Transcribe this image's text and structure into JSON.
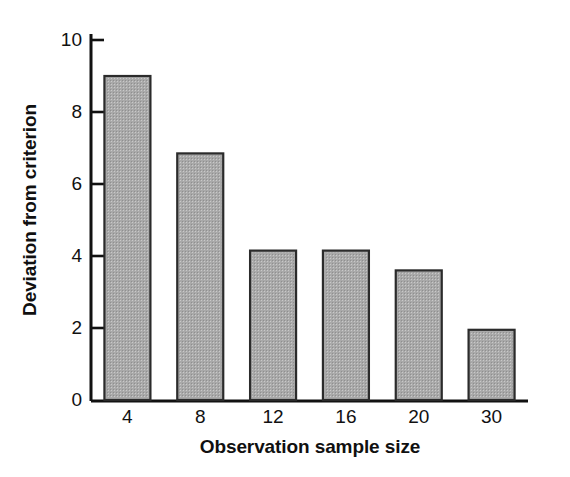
{
  "chart_data": {
    "type": "bar",
    "title": "",
    "subtitle": "",
    "xlabel": "Observation sample size",
    "ylabel": "Deviation from criterion",
    "categories": [
      "4",
      "8",
      "12",
      "16",
      "20",
      "30"
    ],
    "values": [
      9.0,
      6.85,
      4.15,
      4.15,
      3.6,
      1.95
    ],
    "series": [
      {
        "name": "Deviation from criterion",
        "values": [
          9.0,
          6.85,
          4.15,
          4.15,
          3.6,
          1.95
        ]
      }
    ],
    "ylim": [
      0,
      10.4
    ],
    "xlim": [
      0,
      6
    ],
    "yticks": [
      0,
      2,
      4,
      6,
      8,
      10
    ],
    "ytick_labels": [
      "0",
      "2",
      "4",
      "6",
      "8",
      "10"
    ],
    "xtick_labels": [
      "4",
      "8",
      "12",
      "16",
      "20",
      "30"
    ],
    "grid": false,
    "legend": false,
    "legend_position": "none",
    "bar_fill_color": "#a9a9a9",
    "bar_edge_color": "#2b2b2b",
    "axis_color": "#111111",
    "background_color": "#ffffff",
    "text_color": "#111111"
  },
  "figure": {
    "axis_title_x": "Observation sample size",
    "axis_title_y": "Deviation from criterion"
  }
}
